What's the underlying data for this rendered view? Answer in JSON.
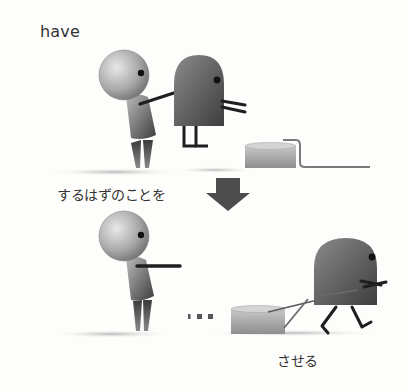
{
  "illustration": {
    "top_panel": {
      "caption": "have",
      "description": "person touching a ghost-like creature next to a tub with a rope"
    },
    "transition": {
      "caption": "するはずのことを",
      "arrow": "down-arrow-icon"
    },
    "bottom_panel": {
      "caption": "させる",
      "ellipsis": "■■■",
      "description": "person pointing while the creature pulls the tub by a rope"
    },
    "colors": {
      "background": "#fdfdfb",
      "text": "#333333",
      "figure_light": "#d8d8d8",
      "figure_dark": "#4a4a4a",
      "line": "#1e1e1e",
      "arrow": "#4d4d4d"
    }
  }
}
